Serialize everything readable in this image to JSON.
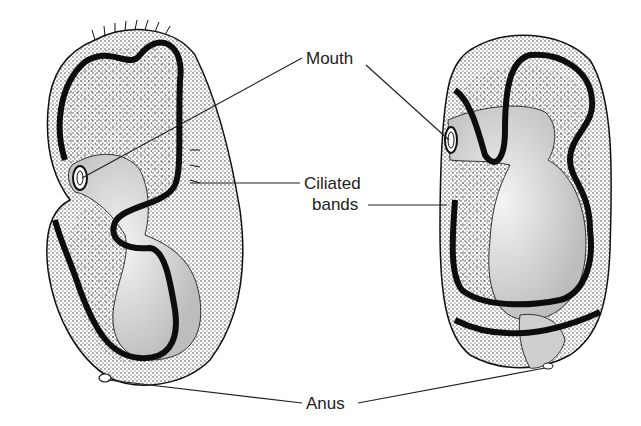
{
  "figure": {
    "type": "scientific illustration",
    "views": [
      "left larva (lateral view)",
      "right larva (ventral view)"
    ]
  },
  "labels": {
    "mouth": "Mouth",
    "ciliated_1": "Ciliated",
    "ciliated_2": "bands",
    "anus": "Anus"
  },
  "colors": {
    "ink": "#111111",
    "band": "#0d0d0d",
    "gut_shade": "#d8d8d8",
    "background": "#ffffff"
  }
}
